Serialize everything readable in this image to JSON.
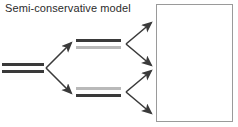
{
  "figure": {
    "title": "Semi-conservative model",
    "background_color": "#ffffff",
    "width": 238,
    "height": 127
  },
  "colors": {
    "parental_strand": "#3a3a3a",
    "new_strand": "#b9b9b9",
    "arrow": "#3a3a3a",
    "box_border": "#9a9a9a",
    "text": "#2b2b2b"
  },
  "duplexes": [
    {
      "id": "parent",
      "label": "parental-duplex",
      "generation": 0,
      "top_strand": "parental",
      "bottom_strand": "parental"
    },
    {
      "id": "daughter-top",
      "label": "first-generation-duplex-upper",
      "generation": 1,
      "top_strand": "parental",
      "bottom_strand": "new"
    },
    {
      "id": "daughter-bottom",
      "label": "first-generation-duplex-lower",
      "generation": 1,
      "top_strand": "new",
      "bottom_strand": "parental"
    }
  ],
  "arrows": [
    {
      "id": "fork-1-up",
      "from": [
        46,
        68
      ],
      "to": [
        72,
        42
      ]
    },
    {
      "id": "fork-1-down",
      "from": [
        46,
        68
      ],
      "to": [
        72,
        94
      ]
    },
    {
      "id": "fork-2-up",
      "from": [
        126,
        44
      ],
      "to": [
        152,
        22
      ]
    },
    {
      "id": "fork-2-down",
      "from": [
        126,
        44
      ],
      "to": [
        152,
        66
      ]
    },
    {
      "id": "fork-3-up",
      "from": [
        126,
        92
      ],
      "to": [
        152,
        70
      ]
    },
    {
      "id": "fork-3-down",
      "from": [
        126,
        92
      ],
      "to": [
        152,
        114
      ]
    }
  ],
  "result_box": {
    "label": "second-generation-result-panel",
    "content": ""
  }
}
